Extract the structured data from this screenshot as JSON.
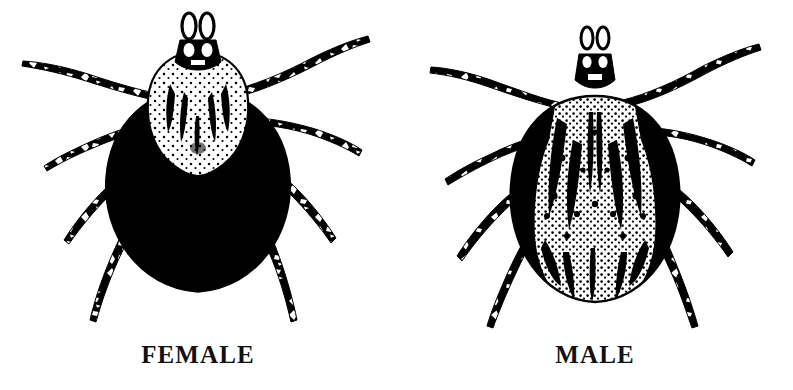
{
  "figure": {
    "background_color": "#ffffff",
    "ink_color": "#000000",
    "style": "black-and-white scientific line illustration",
    "panel_count": 2
  },
  "panels": [
    {
      "id": "female",
      "label": "FEMALE",
      "label_color": "#111111",
      "body": {
        "abdomen_fill": "solid-black",
        "scutum_fill": "white-with-dark-stripes-and-stipple",
        "scutum_position": "anterior-upper-body",
        "leg_count": 8,
        "leg_pattern": "banded black and white",
        "capitulum": "dark mouthparts with paired palps"
      }
    },
    {
      "id": "male",
      "label": "MALE",
      "label_color": "#111111",
      "body": {
        "abdomen_fill": "ornate-black-and-white-mottled",
        "scutum_fill": "full-body ornate pattern",
        "scutum_position": "covers-entire-dorsum",
        "leg_count": 8,
        "leg_pattern": "dark with white bands",
        "capitulum": "dark mouthparts with paired palps"
      }
    }
  ]
}
